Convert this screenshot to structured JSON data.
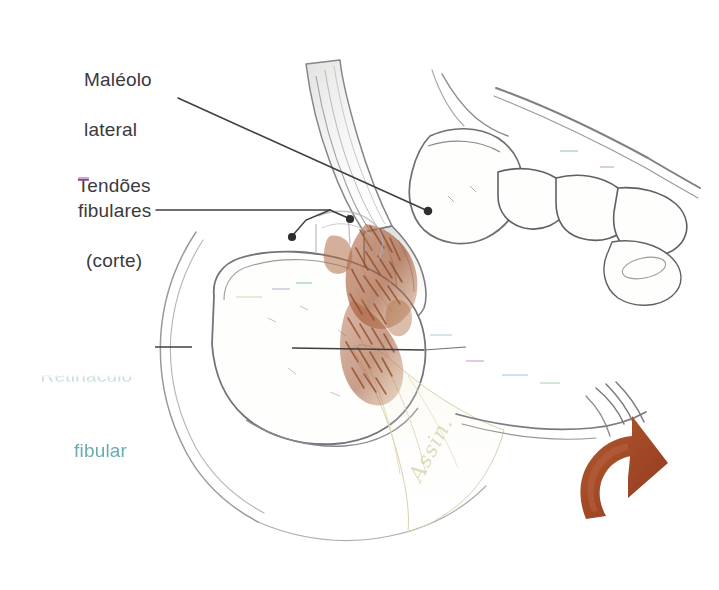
{
  "figure": {
    "background_color": "#ffffff",
    "width": 719,
    "height": 590,
    "media": "desenho a lápis digitalizado, com realce em cor"
  },
  "labels": {
    "malleolus": {
      "line1": "Maléolo",
      "line2": "lateral",
      "text_color": "#3a3a3c"
    },
    "tendons": {
      "line1": "Tendões",
      "line2": "fibulares",
      "line3": "(corte)",
      "text_color": "#3a3a3c"
    },
    "retinaculum": {
      "line1": "Retináculo",
      "line2": "fibular",
      "line1_color": "#4b4b4d",
      "line1_artifact_color": "#2f8f5a",
      "line2_color": "#4aa8ae",
      "condition": "degradado"
    }
  },
  "signature": {
    "text": "Assin."
  },
  "colors": {
    "ink": "#4a4a4c",
    "ink_light": "#8e8e90",
    "tendon_brown": "#a8603c",
    "tendon_brown_dark": "#8a4526",
    "arrow_rust": "#a84e2a",
    "arrow_rust_dark": "#8d3d1e",
    "bone_fill": "#fdfdfb",
    "signature_yellow": "#cfc79a",
    "artifact_green": "#2f8f5a",
    "artifact_cyan": "#4aa8ae",
    "artifact_magenta": "#b05ab8"
  },
  "leaders": {
    "malleolus": {
      "path": "M 178 98 L 428 211",
      "dot": {
        "x": 428,
        "y": 211,
        "r": 4.2
      }
    },
    "tendons": {
      "path": "M 156 210 L 330 210",
      "fork_a": "M 330 210 L 300 224 L 292 236",
      "fork_b": "M 330 210 L 348 218",
      "dot_a": {
        "x": 291,
        "y": 237,
        "r": 4.0
      },
      "dot_b": {
        "x": 350,
        "y": 219,
        "r": 4.0
      }
    },
    "retinaculum": {
      "dash": "M 155 347 L 192 347",
      "path": "M 292 348 L 424 350"
    }
  },
  "arrow": {
    "name": "eversion-arrow",
    "meaning": "movimento de eversão / rotação",
    "color": "#a84e2a"
  },
  "structures": [
    {
      "name": "fibula",
      "label": "Fíbula"
    },
    {
      "name": "lateral-malleolus",
      "label": "Maléolo lateral"
    },
    {
      "name": "talus",
      "label": "Tálus"
    },
    {
      "name": "calcaneus",
      "label": "Calcâneo"
    },
    {
      "name": "metatarsals",
      "label": "Metatarsos"
    },
    {
      "name": "fibular-tendons-cut",
      "label": "Tendões fibulares (corte)"
    },
    {
      "name": "fibular-retinaculum",
      "label": "Retináculo fibular"
    }
  ]
}
